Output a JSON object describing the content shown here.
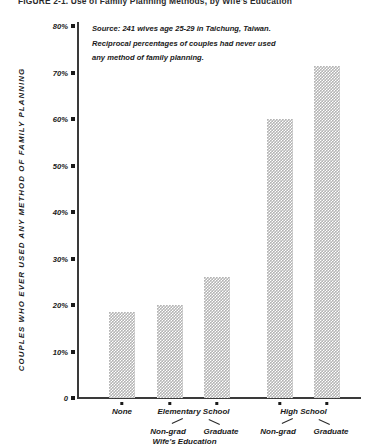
{
  "figure": {
    "title": "FIGURE 2-1.  Use of Family Planning Methods, by Wife's Education"
  },
  "note": {
    "line1": "Source: 241 wives age 25-29 in Taichung, Taiwan.",
    "line2": "Reciprocal percentages of couples had never used",
    "line3": "any method of family planning."
  },
  "axes": {
    "y_title": "COUPLES WHO EVER USED ANY METHOD OF FAMILY PLANNING",
    "x_title": "Wife's Education",
    "y_ticks": [
      "80%",
      "70%",
      "60%",
      "50%",
      "40%",
      "30%",
      "20%",
      "10%",
      "0"
    ]
  },
  "groups": [
    {
      "label": "None",
      "sub": ""
    },
    {
      "label": "Elementary School",
      "sub": "Non-grad"
    },
    {
      "label": "",
      "sub": "Graduate"
    },
    {
      "label": "High School",
      "sub": "Non-grad"
    },
    {
      "label": "",
      "sub": "Graduate"
    }
  ],
  "chart_data": {
    "type": "bar",
    "title": "FIGURE 2-1.  Use of Family Planning Methods, by Wife's Education",
    "xlabel": "Wife's Education",
    "ylabel": "COUPLES WHO EVER USED ANY METHOD OF FAMILY PLANNING",
    "categories": [
      "None",
      "Elementary School Non-grad",
      "Elementary School Graduate",
      "High School Non-grad",
      "High School Graduate"
    ],
    "values": [
      18.5,
      20,
      26,
      60,
      71.5
    ],
    "ylim": [
      0,
      80
    ],
    "ytick_values": [
      0,
      10,
      20,
      30,
      40,
      50,
      60,
      70,
      80
    ],
    "ytick_labels": [
      "0",
      "10%",
      "20%",
      "30%",
      "40%",
      "50%",
      "60%",
      "70%",
      "80%"
    ],
    "grid": false,
    "legend": "none",
    "bar_fill": "#b4b4b4",
    "bar_pattern": "checkered",
    "annotations": [
      "Source: 241 wives age 25-29 in Taichung, Taiwan.",
      "Reciprocal percentages of couples had never used",
      "any method of family planning."
    ]
  }
}
